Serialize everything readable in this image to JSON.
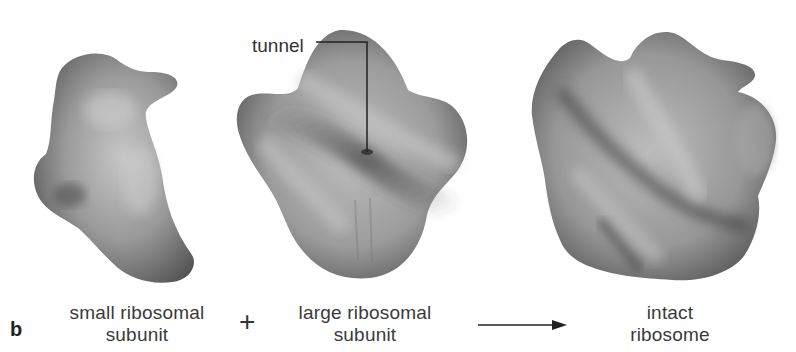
{
  "panel": {
    "letter": "b"
  },
  "annotations": {
    "tunnel": "tunnel"
  },
  "operators": {
    "plus": "+",
    "arrow": "reaction-arrow"
  },
  "subunits": [
    {
      "id": "small",
      "line1": "small ribosomal",
      "line2": "subunit"
    },
    {
      "id": "large",
      "line1": "large ribosomal",
      "line2": "subunit"
    },
    {
      "id": "intact",
      "line1": "intact",
      "line2": "ribosome"
    }
  ],
  "colors": {
    "background": "#ffffff",
    "shape_light": "#c9c9c9",
    "shape_mid": "#8e8e8e",
    "shape_dark": "#4a4a4a",
    "text": "#333333"
  }
}
